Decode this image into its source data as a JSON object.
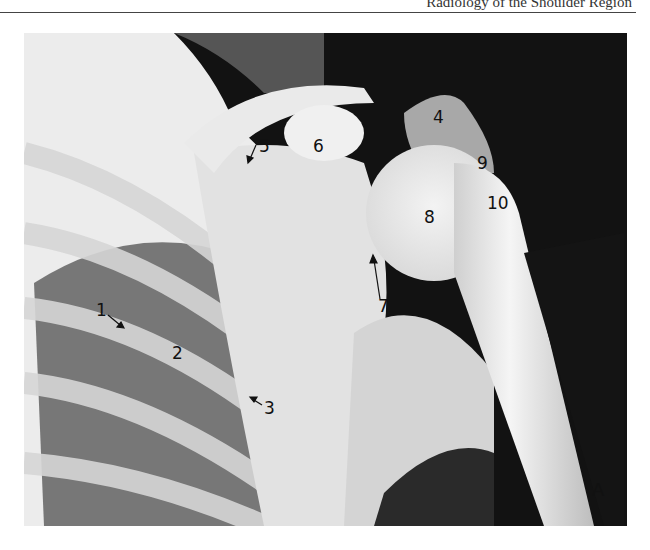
{
  "page": {
    "running_head": "Radiology of the Shoulder Region"
  },
  "figure": {
    "type": "radiograph",
    "panel_letter": "A",
    "labels": [
      {
        "id": "1",
        "text": "1",
        "x": 96,
        "y": 302
      },
      {
        "id": "2",
        "text": "2",
        "x": 172,
        "y": 345
      },
      {
        "id": "3",
        "text": "3",
        "x": 264,
        "y": 400
      },
      {
        "id": "4",
        "text": "4",
        "x": 433,
        "y": 109
      },
      {
        "id": "5",
        "text": "5",
        "x": 259,
        "y": 138
      },
      {
        "id": "6",
        "text": "6",
        "x": 313,
        "y": 138
      },
      {
        "id": "7",
        "text": "7",
        "x": 378,
        "y": 298
      },
      {
        "id": "8",
        "text": "8",
        "x": 424,
        "y": 209
      },
      {
        "id": "9",
        "text": "9",
        "x": 477,
        "y": 155
      },
      {
        "id": "10",
        "text": "10",
        "x": 487,
        "y": 195
      }
    ],
    "colors": {
      "film_dark": "#111111",
      "bone_light": "#f2f2f2",
      "label_ink": "#111111"
    }
  }
}
